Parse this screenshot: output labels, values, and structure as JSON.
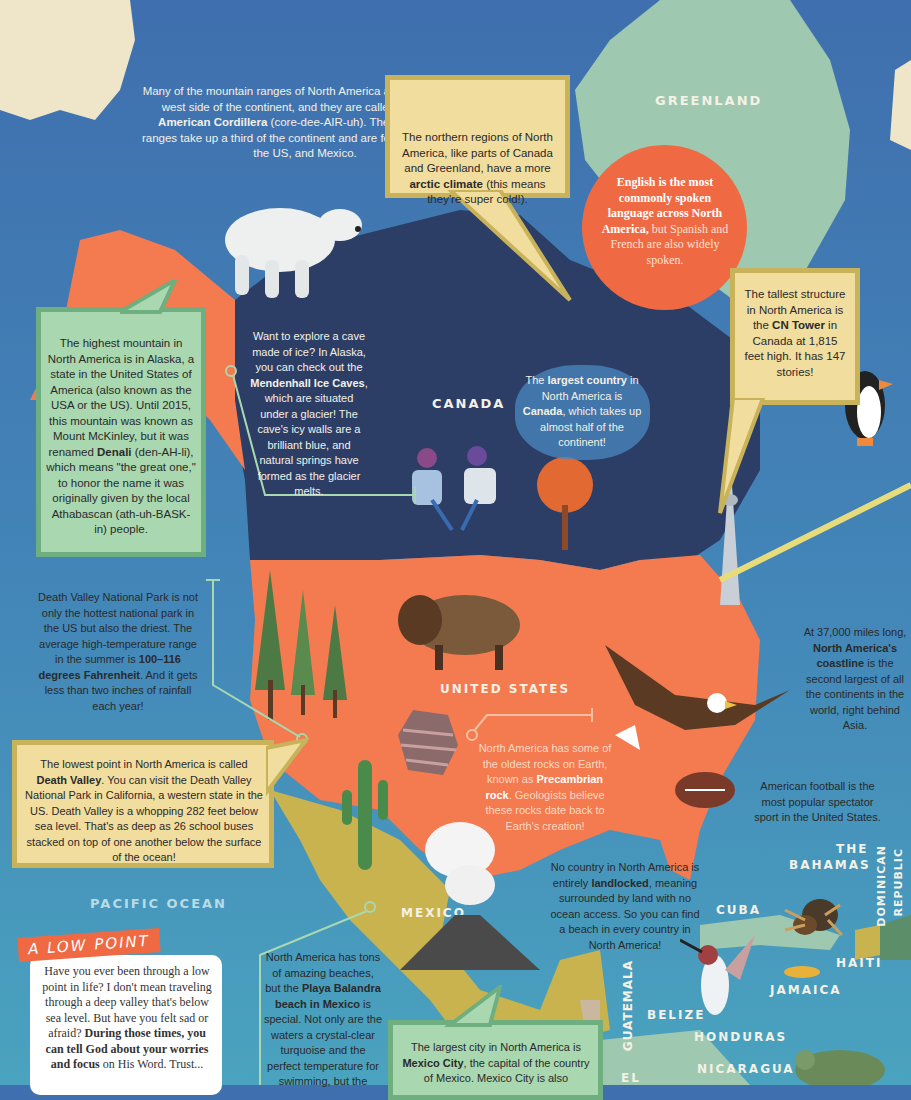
{
  "colors": {
    "ocean_north": "#3f6fae",
    "ocean_south": "#4a9fbe",
    "canada": "#2c3e66",
    "united_states": "#f47a4f",
    "greenland": "#9fc8b0",
    "mexico": "#c9b34e",
    "yellow_box": "#f1dd9e",
    "green_box": "#a9d7b0",
    "english_circle": "#ef6a43"
  },
  "labels": {
    "greenland": "GREENLAND",
    "canada": "CANADA",
    "united_states": "UNITED STATES",
    "pacific_ocean": "PACIFIC OCEAN",
    "mexico": "MEXICO",
    "the_bahamas_1": "THE",
    "the_bahamas_2": "BAHAMAS",
    "dominican_republic_1": "DOMINICAN",
    "dominican_republic_2": "REPUBLIC",
    "cuba": "CUBA",
    "haiti": "HAITI",
    "jamaica": "JAMAICA",
    "guatemala": "GUATEMALA",
    "belize": "BELIZE",
    "honduras": "HONDURAS",
    "nicaragua": "NICARAGUA",
    "el_salvador_partial": "EL"
  },
  "facts": {
    "cordillera": {
      "p1": "Many of the mountain ranges of North America are found on the west side of the continent, and they are called the ",
      "bold": "North American Cordillera",
      "p2": " (core-dee-AIR-uh). These mountain ranges take up a third of the continent and are found in Canada, the US, and Mexico."
    },
    "arctic": {
      "p1": "The northern regions of North America, like parts of Canada and Greenland, have a more ",
      "bold": "arctic climate",
      "p2": " (this means they're super cold!)."
    },
    "english": {
      "bold": "English is the most commonly spoken language across North America,",
      "p2": " but Spanish and French are also widely spoken."
    },
    "denali": {
      "p1": "The highest mountain in North America is in Alaska, a state in the United States of America (also known as the USA or the US). Until 2015, this mountain was known as Mount McKinley, but it was renamed ",
      "bold": "Denali",
      "p2": " (den-AH-li), which means \"the great one,\" to honor the name it was originally given by the local Athabascan (ath-uh-BASK-in) people."
    },
    "ice_caves": {
      "p1": "Want to explore a cave made of ice? In Alaska, you can check out the ",
      "bold": "Mendenhall Ice Caves",
      "p2": ", which are situated under a glacier! The cave's icy walls are a brilliant blue, and natural springs have formed as the glacier melts."
    },
    "largest_country": {
      "p1": "The ",
      "bold1": "largest country",
      "p2": " in North America is ",
      "bold2": "Canada",
      "p3": ", which takes up almost half of the continent!"
    },
    "cn_tower": {
      "p1": "The tallest structure in North America is the ",
      "bold": "CN Tower",
      "p2": " in Canada at 1,815 feet high. It has 147 stories!"
    },
    "death_valley_park": {
      "p1": "Death Valley National Park is not only the hottest national park in the US but also the driest. The average high-temperature range in the summer is ",
      "bold": "100–116 degrees Fahrenheit",
      "p2": ". And it gets less than two inches of rainfall each year!"
    },
    "coastline": {
      "p1": "At 37,000 miles long, ",
      "bold": "North America's coastline",
      "p2": " is the second largest of all the continents in the world, right behind Asia."
    },
    "lowest_point": {
      "p1": "The lowest point in North America is called ",
      "bold": "Death Valley",
      "p2": ". You can visit the Death Valley National Park in California, a western state in the US. Death Valley is a whopping 282 feet below sea level. That's as deep as 26 school buses stacked on top of one another below the surface of the ocean!"
    },
    "precambrian": {
      "p1": "North America has some of the oldest rocks on Earth, known as ",
      "bold": "Precambrian rock",
      "p2": ". Geologists believe these rocks date back to Earth's creation!"
    },
    "football": {
      "text": "American football is the most popular spectator sport in the United States."
    },
    "landlocked": {
      "p1": "No country in North America is entirely ",
      "bold": "landlocked",
      "p2": ", meaning surrounded by land with no ocean access. So you can find a beach in every country in North America!"
    },
    "beaches": {
      "p1": "North America has tons of amazing beaches, but the ",
      "bold": "Playa Balandra beach in Mexico",
      "p2": " is special. Not only are the waters a crystal-clear turquoise and the perfect temperature for swimming, but the"
    },
    "mexico_city": {
      "p1": "The largest city in North America is ",
      "bold": "Mexico City",
      "p2": ", the capital of the country of Mexico. Mexico City is also"
    }
  },
  "low_point": {
    "tag": "A LOW POINT",
    "p1": "Have you ever been through a low point in life? I don't mean traveling through a deep valley that's below sea level. But have you felt sad or afraid? ",
    "bold": "During those times, you can tell God about your worries and focus",
    "p2": " on His Word. Trust..."
  }
}
